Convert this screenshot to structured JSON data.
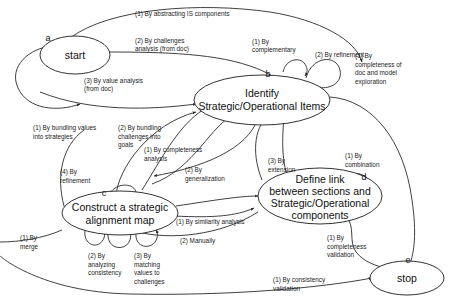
{
  "diagram": {
    "background_color": "#ffffff",
    "line_color": "#2a2a2a",
    "text_color": "#101010",
    "nodes": [
      {
        "id": "start",
        "letter": "a",
        "lines": [
          "start"
        ]
      },
      {
        "id": "identify",
        "letter": "b",
        "lines": [
          "Identify",
          "Strategic/Operational Items"
        ]
      },
      {
        "id": "construct",
        "letter": "c",
        "lines": [
          "Construct a strategic",
          "alignment map"
        ]
      },
      {
        "id": "define",
        "letter": "d",
        "lines": [
          "Define link",
          "between sections and",
          "Strategic/Operational",
          "components"
        ]
      },
      {
        "id": "stop",
        "letter": "e",
        "lines": [
          "stop"
        ]
      }
    ],
    "edge_labels": [
      {
        "id": "abstracting-is-components",
        "lines": [
          "(1) By abstracting IS components"
        ]
      },
      {
        "id": "challenges-analysis-from-doc",
        "lines": [
          "(2) By challenges",
          "analysis (from doc)"
        ]
      },
      {
        "id": "value-analysis-from-doc",
        "lines": [
          "(3) By value analysis",
          "(from doc)"
        ]
      },
      {
        "id": "complementary",
        "lines": [
          "(1) By",
          "complementary"
        ]
      },
      {
        "id": "refinement-identify",
        "lines": [
          "(2) By refinement"
        ]
      },
      {
        "id": "completeness-of-doc-and-model-exploration",
        "lines": [
          "(1) By",
          "completeness of",
          "doc and model",
          "exploration"
        ]
      },
      {
        "id": "bundling-values-into-strategies",
        "lines": [
          "(1) By bundling values",
          "into strategies"
        ]
      },
      {
        "id": "bundling-challenges-into-goals",
        "lines": [
          "(2) By bundling",
          "challenges into",
          "goals"
        ]
      },
      {
        "id": "completeness-analysis",
        "lines": [
          "(1) By completeness",
          "analysis"
        ]
      },
      {
        "id": "generalization",
        "lines": [
          "(2) By",
          "generalization"
        ]
      },
      {
        "id": "extension",
        "lines": [
          "(3) By",
          "extension"
        ]
      },
      {
        "id": "combination",
        "lines": [
          "(1) By",
          "combination"
        ]
      },
      {
        "id": "refinement-construct",
        "lines": [
          "(4) By",
          "refinement"
        ]
      },
      {
        "id": "similarity-analysis",
        "lines": [
          "(1) By similarity analysis"
        ]
      },
      {
        "id": "manually",
        "lines": [
          "(2) Manually"
        ]
      },
      {
        "id": "merge",
        "lines": [
          "(1) By",
          "merge"
        ]
      },
      {
        "id": "analyzing-consistency",
        "lines": [
          "(2) By",
          "analyzing",
          "consistency"
        ]
      },
      {
        "id": "matching-values-to-challenges",
        "lines": [
          "(3) By",
          "matching",
          "values to",
          "challenges"
        ]
      },
      {
        "id": "completeness-validation",
        "lines": [
          "(1) By",
          "completeness",
          "validation"
        ]
      },
      {
        "id": "consistency-validation",
        "lines": [
          "(1) By consistency",
          "validation"
        ]
      }
    ]
  }
}
